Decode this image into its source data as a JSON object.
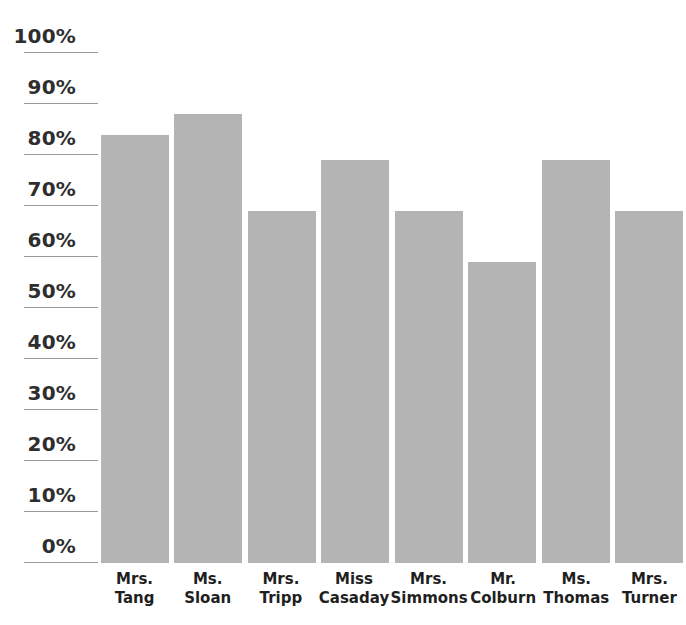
{
  "chart_data": {
    "type": "bar",
    "title": "",
    "subtitle": "",
    "xlabel": "",
    "ylabel": "",
    "ylim": [
      0,
      100
    ],
    "grid": true,
    "legend": null,
    "orientation": "vertical",
    "bar_color": "#b4b4b4",
    "background_color": "#ffffff",
    "axis_text_color": "#2e2e2e",
    "gridline_color": "#9a9a9a",
    "categories": [
      "Mrs. Tang",
      "Ms. Sloan",
      "Mrs. Tripp",
      "Miss Casaday",
      "Mrs. Simmons",
      "Mr. Colburn",
      "Ms. Thomas",
      "Mrs. Turner"
    ],
    "category_lines": [
      {
        "line1": "Mrs.",
        "line2": "Tang"
      },
      {
        "line1": "Ms.",
        "line2": "Sloan"
      },
      {
        "line1": "Mrs.",
        "line2": "Tripp"
      },
      {
        "line1": "Miss",
        "line2": "Casaday"
      },
      {
        "line1": "Mrs.",
        "line2": "Simmons"
      },
      {
        "line1": "Mr.",
        "line2": "Colburn"
      },
      {
        "line1": "Ms.",
        "line2": "Thomas"
      },
      {
        "line1": "Mrs.",
        "line2": "Turner"
      }
    ],
    "values": [
      84,
      88,
      69,
      79,
      69,
      59,
      79,
      69
    ],
    "value_unit": "%",
    "yticks": [
      0,
      10,
      20,
      30,
      40,
      50,
      60,
      70,
      80,
      90,
      100
    ],
    "ytick_labels": [
      "0%",
      "10%",
      "20%",
      "30%",
      "40%",
      "50%",
      "60%",
      "70%",
      "80%",
      "90%",
      "100%"
    ]
  }
}
